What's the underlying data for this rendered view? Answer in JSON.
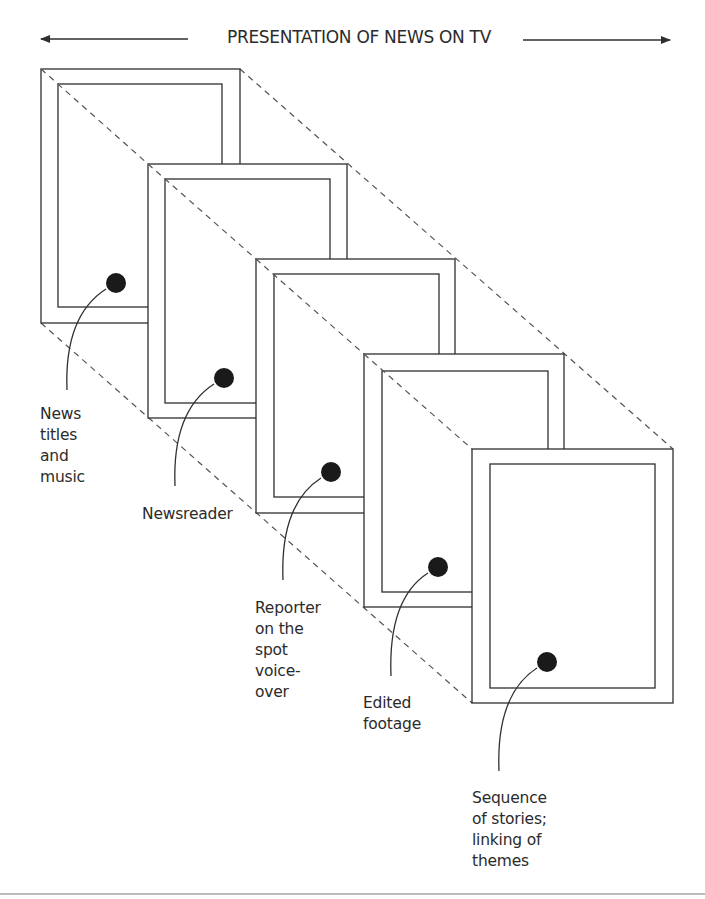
{
  "diagram": {
    "title": "PRESENTATION OF NEWS ON TV",
    "direction_arrow": {
      "left_arrow": "bidirectional-arrow-left",
      "right_arrow": "bidirectional-arrow-right"
    },
    "line_color": "#2f2f2f",
    "dash_color": "#555555",
    "dot_color": "#1a1a1a",
    "frames": [
      {
        "order": 1,
        "label": "News\ntitles\nand\nmusic",
        "outer": [
          41,
          69,
          240,
          323
        ],
        "inner": [
          58,
          84,
          222,
          307
        ],
        "dot": [
          116,
          283
        ],
        "leader_end": [
          67,
          390
        ],
        "label_pos": [
          40,
          405
        ]
      },
      {
        "order": 2,
        "label": "Newsreader",
        "outer": [
          148,
          164,
          347,
          418
        ],
        "inner": [
          165,
          179,
          330,
          403
        ],
        "dot": [
          224,
          378
        ],
        "leader_end": [
          175,
          486
        ],
        "label_pos": [
          142,
          505
        ]
      },
      {
        "order": 3,
        "label": "Reporter\non the\nspot\nvoice-\nover",
        "outer": [
          256,
          259,
          455,
          513
        ],
        "inner": [
          274,
          274,
          439,
          497
        ],
        "dot": [
          331,
          472
        ],
        "leader_end": [
          283,
          580
        ],
        "label_pos": [
          255,
          599
        ]
      },
      {
        "order": 4,
        "label": "Edited\nfootage",
        "outer": [
          364,
          354,
          564,
          607
        ],
        "inner": [
          382,
          371,
          548,
          592
        ],
        "dot": [
          438,
          567
        ],
        "leader_end": [
          391,
          676
        ],
        "label_pos": [
          363,
          694
        ]
      },
      {
        "order": 5,
        "label": "Sequence\nof stories;\nlinking of\nthemes",
        "outer": [
          472,
          449,
          673,
          703
        ],
        "inner": [
          490,
          464,
          655,
          688
        ],
        "dot": [
          547,
          662
        ],
        "leader_end": [
          499,
          771
        ],
        "label_pos": [
          472,
          789
        ]
      }
    ],
    "labels": {
      "frame_1": "News\ntitles\nand\nmusic",
      "frame_2": "Newsreader",
      "frame_3": "Reporter\non the\nspot\nvoice-\nover",
      "frame_4": "Edited\nfootage",
      "frame_5": "Sequence\nof stories;\nlinking of\nthemes"
    }
  }
}
